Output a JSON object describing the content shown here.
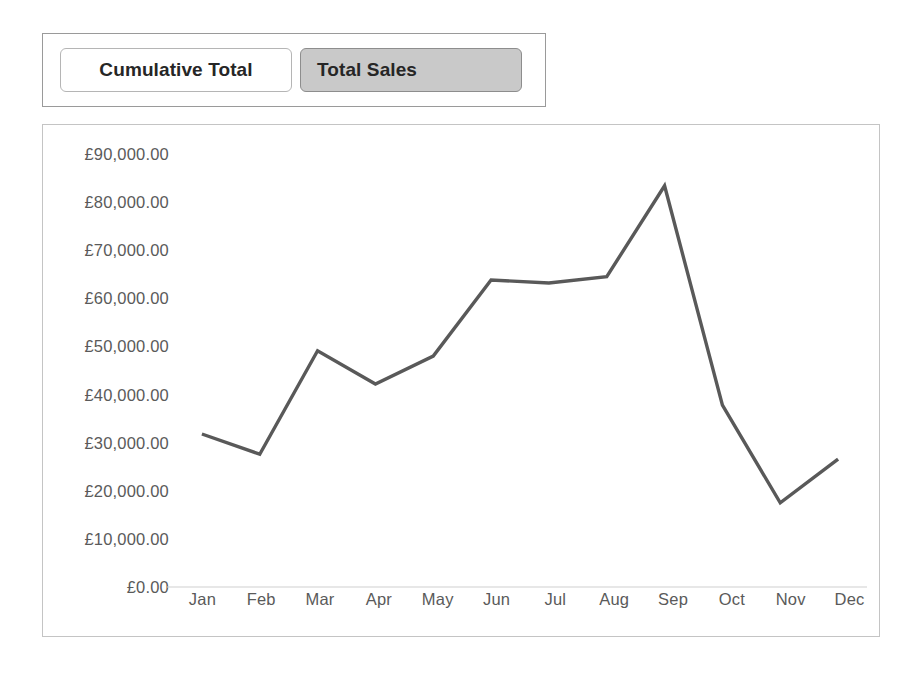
{
  "toolbar": {
    "buttons": [
      {
        "label": "Cumulative Total",
        "state": "unselected"
      },
      {
        "label": "Total Sales",
        "state": "selected"
      }
    ]
  },
  "colors": {
    "line": "#595959",
    "axis": "#d0d0d0",
    "tick_text": "#5a5a5a",
    "selected_button_bg": "#c9c9c9",
    "unselected_button_bg": "#ffffff",
    "panel_border": "#c4c4c4"
  },
  "chart_data": {
    "type": "line",
    "title": "",
    "xlabel": "",
    "ylabel": "",
    "categories": [
      "Jan",
      "Feb",
      "Mar",
      "Apr",
      "May",
      "Jun",
      "Jul",
      "Aug",
      "Sep",
      "Oct",
      "Nov",
      "Dec"
    ],
    "series": [
      {
        "name": "Total Sales",
        "values": [
          31800,
          27600,
          49100,
          42200,
          48000,
          63800,
          63200,
          64500,
          83400,
          37800,
          17500,
          26600
        ]
      }
    ],
    "ylim": [
      0,
      90000
    ],
    "y_ticks": [
      0,
      10000,
      20000,
      30000,
      40000,
      50000,
      60000,
      70000,
      80000,
      90000
    ],
    "y_tick_labels": [
      "£0.00",
      "£10,000.00",
      "£20,000.00",
      "£30,000.00",
      "£40,000.00",
      "£50,000.00",
      "£60,000.00",
      "£70,000.00",
      "£80,000.00",
      "£90,000.00"
    ],
    "grid": false,
    "legend": "none",
    "currency_symbol": "£"
  }
}
